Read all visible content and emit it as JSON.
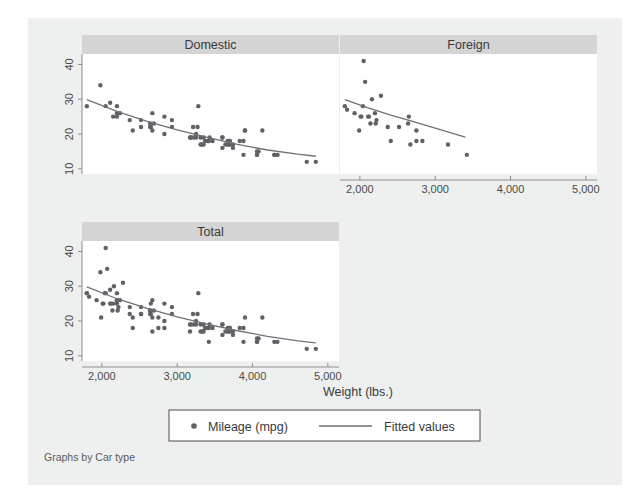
{
  "figure": {
    "note": "Graphs by Car type",
    "xlabel": "Weight (lbs.)",
    "background": "#eef0ef",
    "marker_color": "#5f6166",
    "line_color": "#6e7176",
    "title_bar_color": "#d4d4d4"
  },
  "legend": {
    "marker_label": "Mileage (mpg)",
    "line_label": "Fitted values"
  },
  "panels": [
    {
      "name": "domestic",
      "title": "Domestic"
    },
    {
      "name": "foreign",
      "title": "Foreign"
    },
    {
      "name": "total",
      "title": "Total"
    }
  ],
  "axes": {
    "x_ticks": [
      2000,
      3000,
      4000,
      5000
    ],
    "x_tick_labels": [
      "2,000",
      "3,000",
      "4,000",
      "5,000"
    ],
    "y_ticks": [
      10,
      20,
      30,
      40
    ],
    "y_tick_labels": [
      "10",
      "20",
      "30",
      "40"
    ],
    "xlim": [
      1736,
      5148
    ],
    "ylim": [
      8.5,
      43
    ]
  },
  "chart_data": {
    "type": "scatter",
    "title": "",
    "xlabel": "Weight (lbs.)",
    "ylabel": "Mileage (mpg)",
    "xlim": [
      1736,
      5148
    ],
    "ylim": [
      8.5,
      43
    ],
    "grid": false,
    "legend": [
      "Mileage (mpg)",
      "Fitted values"
    ],
    "legend_position": "bottom",
    "facet_by": "Car type",
    "facets": [
      {
        "name": "Domestic",
        "points": [
          [
            2930,
            22
          ],
          [
            3350,
            17
          ],
          [
            2640,
            22
          ],
          [
            3250,
            20
          ],
          [
            4080,
            15
          ],
          [
            3670,
            18
          ],
          [
            3880,
            14
          ],
          [
            4330,
            14
          ],
          [
            3900,
            21
          ],
          [
            4290,
            14
          ],
          [
            2110,
            29
          ],
          [
            2200,
            28
          ],
          [
            2150,
            25
          ],
          [
            2670,
            26
          ],
          [
            3700,
            18
          ],
          [
            3690,
            18
          ],
          [
            3180,
            19
          ],
          [
            3220,
            19
          ],
          [
            4060,
            14
          ],
          [
            3600,
            19
          ],
          [
            3600,
            19
          ],
          [
            3830,
            18
          ],
          [
            4060,
            14
          ],
          [
            4130,
            21
          ],
          [
            4720,
            12
          ],
          [
            3310,
            19
          ],
          [
            2830,
            20
          ],
          [
            2200,
            25
          ],
          [
            2520,
            24
          ],
          [
            1800,
            28
          ],
          [
            2050,
            28
          ],
          [
            2410,
            21
          ],
          [
            2670,
            21
          ],
          [
            3280,
            28
          ],
          [
            3880,
            18
          ],
          [
            3400,
            18
          ],
          [
            4330,
            14
          ],
          [
            3900,
            21
          ],
          [
            4290,
            14
          ],
          [
            3700,
            17
          ],
          [
            3690,
            17
          ],
          [
            3180,
            19
          ],
          [
            2930,
            24
          ],
          [
            3350,
            19
          ],
          [
            2640,
            23
          ],
          [
            3250,
            19
          ],
          [
            2690,
            23
          ],
          [
            3270,
            22
          ],
          [
            3420,
            18
          ],
          [
            3210,
            22
          ],
          [
            4060,
            15
          ],
          [
            3740,
            17
          ],
          [
            3310,
            17
          ],
          [
            3370,
            18
          ],
          [
            2370,
            24
          ],
          [
            2830,
            25
          ],
          [
            2200,
            26
          ],
          [
            3430,
            19
          ],
          [
            3600,
            16
          ],
          [
            3640,
            17
          ],
          [
            3670,
            17
          ],
          [
            3740,
            16
          ],
          [
            4840,
            12
          ],
          [
            3470,
            18
          ],
          [
            3170,
            19
          ],
          [
            2650,
            22
          ],
          [
            2240,
            26
          ],
          [
            1980,
            34
          ],
          [
            2520,
            22
          ],
          [
            3330,
            17
          ]
        ],
        "fit": [
          [
            1800,
            29.9
          ],
          [
            2200,
            26.5
          ],
          [
            2600,
            23.6
          ],
          [
            3000,
            21.2
          ],
          [
            3400,
            19.0
          ],
          [
            3800,
            17.0
          ],
          [
            4200,
            15.4
          ],
          [
            4600,
            14.2
          ],
          [
            4840,
            13.6
          ]
        ]
      },
      {
        "name": "Foreign",
        "points": [
          [
            2070,
            35
          ],
          [
            2120,
            25
          ],
          [
            2160,
            30
          ],
          [
            2010,
            25
          ],
          [
            2110,
            25
          ],
          [
            2200,
            26
          ],
          [
            2040,
            28
          ],
          [
            1800,
            28
          ],
          [
            2140,
            23
          ],
          [
            2020,
            25
          ],
          [
            2220,
            24
          ],
          [
            1930,
            26
          ],
          [
            1990,
            21
          ],
          [
            2520,
            22
          ],
          [
            2640,
            23
          ],
          [
            2650,
            25
          ],
          [
            2750,
            21
          ],
          [
            2750,
            18
          ],
          [
            3170,
            17
          ],
          [
            3420,
            14
          ],
          [
            2830,
            18
          ],
          [
            2410,
            18
          ],
          [
            2670,
            17
          ],
          [
            2370,
            22
          ],
          [
            2050,
            41
          ],
          [
            2280,
            31
          ],
          [
            2210,
            23
          ],
          [
            1830,
            27
          ]
        ],
        "fit": [
          [
            1800,
            29.9
          ],
          [
            2100,
            27.6
          ],
          [
            2400,
            25.5
          ],
          [
            2700,
            23.6
          ],
          [
            3000,
            21.7
          ],
          [
            3200,
            20.4
          ],
          [
            3400,
            19.1
          ]
        ]
      },
      {
        "name": "Total",
        "points": [
          [
            2930,
            22
          ],
          [
            3350,
            17
          ],
          [
            2640,
            22
          ],
          [
            3250,
            20
          ],
          [
            4080,
            15
          ],
          [
            3670,
            18
          ],
          [
            3880,
            14
          ],
          [
            4330,
            14
          ],
          [
            3900,
            21
          ],
          [
            4290,
            14
          ],
          [
            2110,
            29
          ],
          [
            2200,
            28
          ],
          [
            2150,
            25
          ],
          [
            2670,
            26
          ],
          [
            3700,
            18
          ],
          [
            3690,
            18
          ],
          [
            3180,
            19
          ],
          [
            3220,
            19
          ],
          [
            4060,
            14
          ],
          [
            3600,
            19
          ],
          [
            3600,
            19
          ],
          [
            3830,
            18
          ],
          [
            4060,
            14
          ],
          [
            4130,
            21
          ],
          [
            4720,
            12
          ],
          [
            3310,
            19
          ],
          [
            2830,
            20
          ],
          [
            2200,
            25
          ],
          [
            2520,
            24
          ],
          [
            1800,
            28
          ],
          [
            2050,
            28
          ],
          [
            2410,
            21
          ],
          [
            2670,
            21
          ],
          [
            3280,
            28
          ],
          [
            3880,
            18
          ],
          [
            3400,
            18
          ],
          [
            3700,
            17
          ],
          [
            3690,
            17
          ],
          [
            2930,
            24
          ],
          [
            3350,
            19
          ],
          [
            2640,
            23
          ],
          [
            3250,
            19
          ],
          [
            2690,
            23
          ],
          [
            3270,
            22
          ],
          [
            3420,
            18
          ],
          [
            3210,
            22
          ],
          [
            4060,
            15
          ],
          [
            3740,
            17
          ],
          [
            3310,
            17
          ],
          [
            3370,
            18
          ],
          [
            2370,
            24
          ],
          [
            2830,
            25
          ],
          [
            2200,
            26
          ],
          [
            3430,
            19
          ],
          [
            3600,
            16
          ],
          [
            3640,
            17
          ],
          [
            3670,
            17
          ],
          [
            3740,
            16
          ],
          [
            4840,
            12
          ],
          [
            3470,
            18
          ],
          [
            3170,
            19
          ],
          [
            2650,
            22
          ],
          [
            2240,
            26
          ],
          [
            1980,
            34
          ],
          [
            2520,
            22
          ],
          [
            3330,
            17
          ],
          [
            2070,
            35
          ],
          [
            2120,
            25
          ],
          [
            2160,
            30
          ],
          [
            2010,
            25
          ],
          [
            2110,
            25
          ],
          [
            2200,
            26
          ],
          [
            2040,
            28
          ],
          [
            1800,
            28
          ],
          [
            2140,
            23
          ],
          [
            2020,
            25
          ],
          [
            2220,
            24
          ],
          [
            1930,
            26
          ],
          [
            1990,
            21
          ],
          [
            2520,
            22
          ],
          [
            2640,
            23
          ],
          [
            2650,
            25
          ],
          [
            2750,
            21
          ],
          [
            2750,
            18
          ],
          [
            3170,
            17
          ],
          [
            3420,
            14
          ],
          [
            2830,
            18
          ],
          [
            2410,
            18
          ],
          [
            2670,
            17
          ],
          [
            2370,
            22
          ],
          [
            2050,
            41
          ],
          [
            2280,
            31
          ],
          [
            2210,
            23
          ],
          [
            1830,
            27
          ]
        ],
        "fit": [
          [
            1800,
            29.8
          ],
          [
            2200,
            26.4
          ],
          [
            2600,
            23.6
          ],
          [
            3000,
            21.2
          ],
          [
            3400,
            19.1
          ],
          [
            3800,
            17.2
          ],
          [
            4200,
            15.6
          ],
          [
            4600,
            14.3
          ],
          [
            4840,
            13.7
          ]
        ]
      }
    ]
  }
}
